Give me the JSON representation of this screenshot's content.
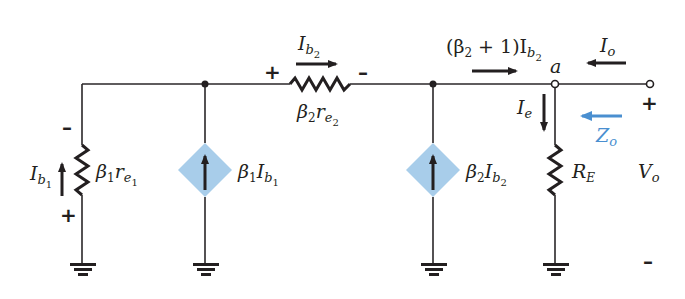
{
  "diagram": {
    "type": "small-signal equivalent circuit",
    "colors": {
      "wire": "#2a2628",
      "source_fill": "#a8cdea",
      "accent": "#4a8fd0"
    },
    "components": {
      "r1": {
        "label_main": "β",
        "label_sub": "1",
        "label_r": "r",
        "label_rsub": "e",
        "label_rsubsub": "1"
      },
      "src1": {
        "label_main": "β",
        "label_sub": "1",
        "label_i": "I",
        "label_isub": "b",
        "label_isubsub": "1"
      },
      "r2": {
        "label_main": "β",
        "label_sub": "2",
        "label_r": "r",
        "label_rsub": "e",
        "label_rsubsub": "2"
      },
      "src2": {
        "label_main": "β",
        "label_sub": "2",
        "label_i": "I",
        "label_isub": "b",
        "label_isubsub": "2"
      },
      "re": {
        "label": "R",
        "label_sub": "E"
      }
    },
    "currents": {
      "ib1": {
        "main": "I",
        "sub": "b",
        "subsub": "1"
      },
      "ib2": {
        "main": "I",
        "sub": "b",
        "subsub": "2"
      },
      "emitter": {
        "prefix": "(β",
        "prefix_sub": "2",
        "mid": " + 1)I",
        "sub": "b",
        "subsub": "2"
      },
      "ie": {
        "main": "I",
        "sub": "e"
      },
      "io": {
        "main": "I",
        "sub": "o"
      }
    },
    "node_label": "a",
    "output": {
      "impedance_main": "Z",
      "impedance_sub": "o",
      "voltage_main": "V",
      "voltage_sub": "o",
      "plus": "+",
      "minus": "–"
    },
    "polarity": {
      "r1_top": "–",
      "r1_bottom": "+",
      "r2_left": "+",
      "r2_right": "–"
    }
  }
}
